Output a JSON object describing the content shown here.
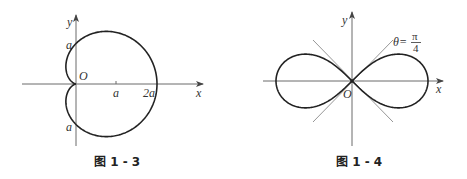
{
  "figures": [
    {
      "id": "fig-1-3",
      "caption": "图 1 - 3",
      "curve": "cardioid",
      "equation_hint": "r = a(1 + cos θ)",
      "labels": {
        "y_axis": "y",
        "x_axis": "x",
        "origin": "O",
        "y_pos": "a",
        "y_neg": "a",
        "x_tick_a": "a",
        "x_tick_2a": "2a"
      }
    },
    {
      "id": "fig-1-4",
      "caption": "图 1 - 4",
      "curve": "lemniscate",
      "equation_hint": "r² = a² cos 2θ",
      "labels": {
        "y_axis": "y",
        "x_axis": "x",
        "origin": "O",
        "theta_prefix": "θ=",
        "theta_num": "π",
        "theta_den": "4"
      }
    }
  ],
  "colors": {
    "curve": "#222222",
    "axis": "#6a6a6a",
    "guide": "#8a8a8a",
    "background": "#ffffff"
  }
}
